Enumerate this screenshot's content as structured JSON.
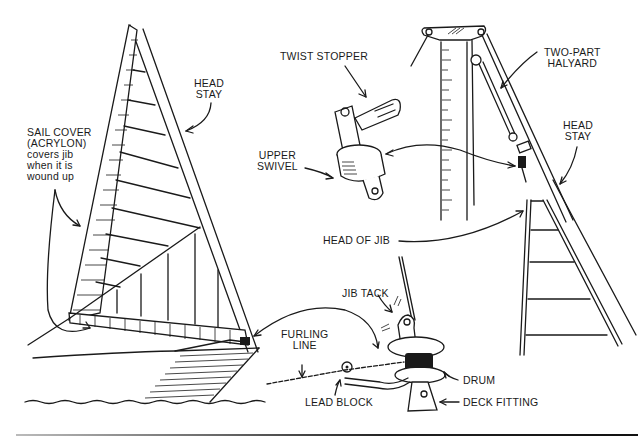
{
  "colors": {
    "ink": "#1a1a1a",
    "background": "#ffffff"
  },
  "labels": {
    "head_stay_left": [
      "HEAD",
      "STAY"
    ],
    "sail_cover": [
      "SAIL COVER",
      "(ACRYLON)",
      "covers jib",
      "when it is",
      "wound up"
    ],
    "twist_stopper": "TWIST STOPPER",
    "upper_swivel": [
      "UPPER",
      "SWIVEL"
    ],
    "two_part_halyard": [
      "TWO-PART",
      "HALYARD"
    ],
    "head_stay_right": [
      "HEAD",
      "STAY"
    ],
    "head_of_jib": "HEAD OF JIB",
    "jib_tack": "JIB TACK",
    "furling_line": [
      "FURLING",
      "LINE"
    ],
    "drum": "DRUM",
    "lead_block": "LEAD BLOCK",
    "deck_fitting": "DECK FITTING"
  },
  "components": [
    "sailboat-bow-with-furled-jib",
    "twist-stopper-and-upper-swivel",
    "masthead-with-two-part-halyard",
    "head-of-jib-on-headstay",
    "furling-drum-assembly"
  ]
}
